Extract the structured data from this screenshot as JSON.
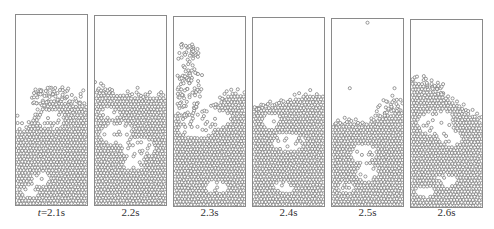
{
  "figure": {
    "panels": [
      {
        "label": "t=2.1s",
        "label_prefix": "t",
        "label_rest": "=2.1s",
        "x": 15,
        "y": 14,
        "w": 73,
        "h": 192,
        "surface": [
          [
            0,
            0.6
          ],
          [
            0.15,
            0.6
          ],
          [
            0.3,
            0.52
          ],
          [
            0.5,
            0.44
          ],
          [
            0.7,
            0.46
          ],
          [
            0.85,
            0.47
          ],
          [
            1,
            0.47
          ]
        ],
        "loose_above": [
          [
            0.2,
            0.38,
            0.95,
            0.47
          ]
        ],
        "voids": [
          [
            0.5,
            0.55,
            0.18,
            0.05
          ],
          [
            0.35,
            0.86,
            0.12,
            0.04
          ],
          [
            0.2,
            0.93,
            0.12,
            0.03
          ]
        ],
        "strays": [
          [
            0.42,
            0.4
          ],
          [
            0.72,
            0.43
          ],
          [
            0.02,
            0.53
          ]
        ]
      },
      {
        "label": "2.2s",
        "x": 94,
        "y": 15,
        "w": 73,
        "h": 191,
        "surface": [
          [
            0,
            0.38
          ],
          [
            0.2,
            0.4
          ],
          [
            0.45,
            0.42
          ],
          [
            0.7,
            0.43
          ],
          [
            1,
            0.43
          ]
        ],
        "loose_above": [],
        "voids": [
          [
            0.3,
            0.62,
            0.22,
            0.06
          ],
          [
            0.6,
            0.7,
            0.25,
            0.05
          ],
          [
            0.55,
            0.78,
            0.15,
            0.04
          ],
          [
            0.2,
            0.52,
            0.15,
            0.03
          ]
        ],
        "strays": [
          [
            0.0,
            0.35
          ],
          [
            0.6,
            0.38
          ]
        ]
      },
      {
        "label": "2.3s",
        "x": 173,
        "y": 16,
        "w": 73,
        "h": 191,
        "surface": [
          [
            0,
            0.55
          ],
          [
            0.4,
            0.52
          ],
          [
            0.7,
            0.43
          ],
          [
            0.85,
            0.4
          ],
          [
            1,
            0.42
          ]
        ],
        "loose_above": [
          [
            0.05,
            0.14,
            0.35,
            0.27
          ],
          [
            0.05,
            0.27,
            0.4,
            0.55
          ]
        ],
        "voids": [
          [
            0.45,
            0.54,
            0.35,
            0.06
          ],
          [
            0.3,
            0.6,
            0.25,
            0.04
          ],
          [
            0.6,
            0.9,
            0.15,
            0.03
          ]
        ],
        "strays": []
      },
      {
        "label": "2.4s",
        "x": 252,
        "y": 17,
        "w": 73,
        "h": 190,
        "surface": [
          [
            0,
            0.5
          ],
          [
            0.3,
            0.47
          ],
          [
            0.55,
            0.44
          ],
          [
            0.75,
            0.41
          ],
          [
            1,
            0.41
          ]
        ],
        "loose_above": [
          [
            0.0,
            0.46,
            0.7,
            0.54
          ]
        ],
        "voids": [
          [
            0.5,
            0.66,
            0.22,
            0.05
          ],
          [
            0.25,
            0.55,
            0.12,
            0.04
          ],
          [
            0.45,
            0.9,
            0.15,
            0.03
          ]
        ],
        "strays": [
          [
            0.65,
            0.4
          ]
        ]
      },
      {
        "label": "2.5s",
        "x": 331,
        "y": 18,
        "w": 73,
        "h": 189,
        "surface": [
          [
            0,
            0.56
          ],
          [
            0.3,
            0.56
          ],
          [
            0.55,
            0.55
          ],
          [
            0.75,
            0.52
          ],
          [
            0.9,
            0.5
          ],
          [
            1,
            0.48
          ]
        ],
        "loose_above": [
          [
            0.6,
            0.43,
            1.0,
            0.52
          ]
        ],
        "voids": [
          [
            0.45,
            0.72,
            0.18,
            0.05
          ],
          [
            0.5,
            0.82,
            0.15,
            0.05
          ],
          [
            0.2,
            0.9,
            0.1,
            0.03
          ]
        ],
        "strays": [
          [
            0.5,
            0.02
          ],
          [
            0.25,
            0.37
          ],
          [
            0.88,
            0.37
          ],
          [
            0.85,
            0.41
          ]
        ]
      },
      {
        "label": "2.6s",
        "x": 410,
        "y": 19,
        "w": 73,
        "h": 189,
        "surface": [
          [
            0,
            0.33
          ],
          [
            0.15,
            0.33
          ],
          [
            0.4,
            0.4
          ],
          [
            0.7,
            0.47
          ],
          [
            0.9,
            0.52
          ],
          [
            1,
            0.54
          ]
        ],
        "loose_above": [
          [
            0.0,
            0.32,
            0.5,
            0.4
          ]
        ],
        "voids": [
          [
            0.35,
            0.55,
            0.25,
            0.07
          ],
          [
            0.55,
            0.63,
            0.15,
            0.04
          ],
          [
            0.5,
            0.86,
            0.15,
            0.03
          ],
          [
            0.2,
            0.92,
            0.12,
            0.03
          ]
        ],
        "strays": [
          [
            0.18,
            0.3
          ]
        ]
      }
    ],
    "particle_color": "#7a7a7a",
    "particle_radius": 1.55,
    "border_color": "#8a8a8a"
  }
}
